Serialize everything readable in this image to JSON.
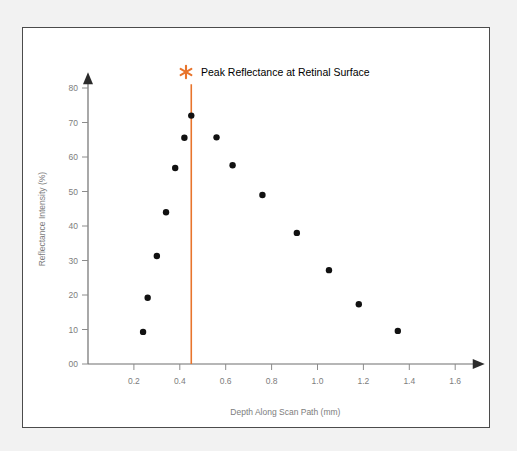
{
  "figure": {
    "background_color": "#ffffff",
    "page_color": "#f2f2f2",
    "border_color": "#4b4b4b"
  },
  "legend": {
    "label": "Peak Reflectance at Retinal Surface",
    "marker_icon": "asterisk-icon",
    "marker_color": "#e8742c",
    "position": "top-center"
  },
  "chart_data": {
    "type": "scatter",
    "title": "",
    "xlabel": "Depth Along Scan Path (mm)",
    "ylabel": "Reflectance Intensity (%)",
    "xlim": [
      0.0,
      1.72
    ],
    "ylim": [
      0,
      84
    ],
    "xticks": [
      "0.2",
      "0.4",
      "0.6",
      "0.8",
      "1.0",
      "1.2",
      "1.4",
      "1.6"
    ],
    "xtick_values": [
      0.2,
      0.4,
      0.6,
      0.8,
      1.0,
      1.2,
      1.4,
      1.6
    ],
    "yticks": [
      "00",
      "10",
      "20",
      "30",
      "40",
      "50",
      "60",
      "70",
      "80"
    ],
    "ytick_values": [
      0,
      10,
      20,
      30,
      40,
      50,
      60,
      70,
      80
    ],
    "grid": false,
    "point_color": "#111111",
    "series": [
      {
        "name": "Reflectance Intensity",
        "x": [
          0.24,
          0.26,
          0.3,
          0.34,
          0.38,
          0.42,
          0.45,
          0.56,
          0.63,
          0.76,
          0.91,
          1.05,
          1.18,
          1.35
        ],
        "y": [
          9.3,
          19.2,
          31.3,
          44.0,
          56.8,
          65.6,
          72.0,
          65.7,
          57.6,
          49.0,
          38.0,
          27.2,
          17.3,
          9.6
        ]
      }
    ],
    "annotations": [
      {
        "type": "vline",
        "x": 0.45,
        "color": "#e8742c",
        "label": "Peak Reflectance at Retinal Surface"
      }
    ]
  }
}
